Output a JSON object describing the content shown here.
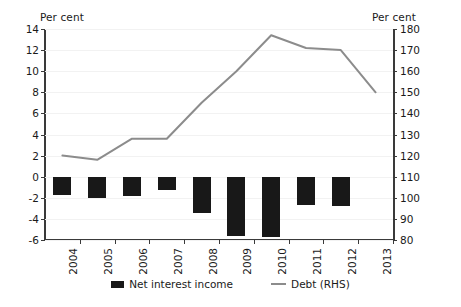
{
  "axes": {
    "left_title": "Per cent",
    "right_title": "Per cent",
    "left_ticks": [
      "14",
      "12",
      "10",
      "8",
      "6",
      "4",
      "2",
      "0",
      "-2",
      "-4",
      "-6"
    ],
    "right_ticks": [
      "180",
      "170",
      "160",
      "150",
      "140",
      "130",
      "120",
      "110",
      "100",
      "90",
      "80"
    ]
  },
  "legend": {
    "items": [
      {
        "label": "Net interest income",
        "type": "bar",
        "color": "#181818"
      },
      {
        "label": "Debt (RHS)",
        "type": "line",
        "color": "#8c8c8c"
      }
    ]
  },
  "chart_data": {
    "type": "bar",
    "title": "",
    "subtitle": "",
    "xlabel": "",
    "ylabel": "Per cent",
    "y2label": "Per cent",
    "categories": [
      "2004",
      "2005",
      "2006",
      "2007",
      "2008",
      "2009",
      "2010",
      "2011",
      "2012",
      "2013"
    ],
    "ylim": [
      -6,
      14
    ],
    "y2lim": [
      80,
      180
    ],
    "ytick_step": 2,
    "y2tick_step": 10,
    "grid": true,
    "legend_position": "bottom",
    "series": [
      {
        "name": "Net interest income",
        "type": "bar",
        "axis": "left",
        "color": "#181818",
        "values": [
          -1.7,
          -2.0,
          -1.8,
          -1.3,
          -3.4,
          -5.6,
          -5.7,
          -2.7,
          -2.8,
          0
        ]
      },
      {
        "name": "Debt (RHS)",
        "type": "line",
        "axis": "right",
        "color": "#8c8c8c",
        "values": [
          120,
          118,
          128,
          128,
          145,
          160,
          177,
          171,
          170,
          150
        ]
      }
    ]
  }
}
